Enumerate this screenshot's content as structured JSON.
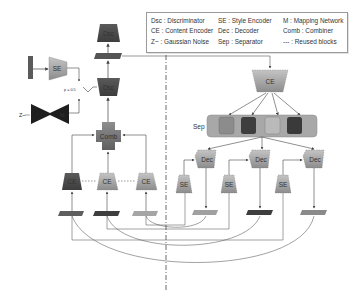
{
  "legend": {
    "col1": [
      "Dsc : Discriminator",
      "CE : Content Encoder",
      "Z~ : Gaussian Noise"
    ],
    "col2": [
      "SE : Style Encoder",
      "Dec : Decoder",
      "Sep : Separator"
    ],
    "col3": [
      "M : Mapping Network",
      "Comb : Combiner",
      "--- : Reused blocks"
    ]
  },
  "blocks": {
    "dsc": "Dsc",
    "dec_main": "Dsc",
    "se_left": "SE",
    "mapping": "M",
    "comb": "Comb",
    "ce_left": [
      "CE",
      "CE",
      "CE"
    ],
    "ce_right": "CE",
    "sep_label": "Sep",
    "dec_right": [
      "Dec",
      "Dec",
      "Dec"
    ],
    "se_right": [
      "SE",
      "SE",
      "SE"
    ],
    "noise_label": "Z~",
    "switch_label": "p = 0.5"
  },
  "colors": {
    "dark": "#4a4a4a",
    "mid": "#6e6e6e",
    "light": "#9c9c9c",
    "lighter": "#b5b5b5",
    "sep_bg": "#a8a8a8",
    "line": "#555555"
  }
}
